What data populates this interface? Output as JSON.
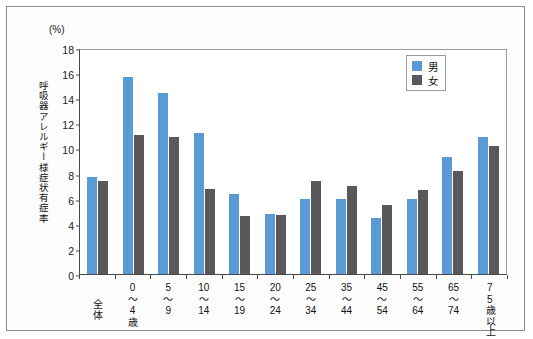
{
  "unit_caption": "(%)",
  "y_axis_title": "呼吸器アレルギー様症状有症率",
  "legend": {
    "male_label": "男",
    "female_label": "女",
    "male_color": "#5B9BD5",
    "female_color": "#595959"
  },
  "axis": {
    "y_ticks": [
      "0",
      "2",
      "4",
      "6",
      "8",
      "10",
      "12",
      "14",
      "16",
      "18"
    ]
  },
  "chart_data": {
    "type": "bar",
    "title": "",
    "subtitle": "",
    "xlabel": "",
    "ylabel": "呼吸器アレルギー様症状有症率",
    "unit": "%",
    "ylim": [
      0,
      18
    ],
    "ytick_step": 2,
    "grid": false,
    "legend_position": "top-right",
    "categories": [
      "全体",
      "0\n〜\n4\n歳",
      "5\n〜\n9",
      "10\n〜\n14",
      "15\n〜\n19",
      "20\n〜\n24",
      "25\n〜\n34",
      "35\n〜\n44",
      "45\n〜\n54",
      "55\n〜\n64",
      "65\n〜\n74",
      "75\n歳\n以\n上"
    ],
    "categories_plain": [
      "全体",
      "0〜4歳",
      "5〜9",
      "10〜14",
      "15〜19",
      "20〜24",
      "25〜34",
      "35〜44",
      "45〜54",
      "55〜64",
      "65〜74",
      "75歳以上"
    ],
    "series": [
      {
        "name": "男",
        "color": "#5B9BD5",
        "values": [
          7.7,
          15.7,
          14.4,
          11.2,
          6.4,
          4.8,
          6.0,
          6.0,
          4.5,
          6.0,
          9.3,
          10.9
        ]
      },
      {
        "name": "女",
        "color": "#595959",
        "values": [
          7.4,
          11.1,
          10.9,
          6.8,
          4.6,
          4.7,
          7.4,
          7.0,
          5.5,
          6.7,
          8.2,
          10.2
        ]
      }
    ]
  }
}
